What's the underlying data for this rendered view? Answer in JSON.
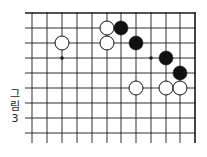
{
  "figure": {
    "caption_chars": [
      "그",
      "림",
      "3"
    ],
    "caption": "그림 3"
  },
  "board": {
    "columns_x": [
      32,
      47,
      62,
      77,
      92,
      107,
      121,
      136,
      151,
      166,
      180,
      195
    ],
    "rows_y": [
      13,
      28,
      43,
      58,
      73,
      88,
      103,
      118,
      133
    ],
    "h_line_start_x": 25,
    "v_line_end_y": 143,
    "top_edge": true,
    "right_edge": true,
    "line_color": "#1a1a1a",
    "star_points": [
      {
        "col": 2,
        "row": 3
      },
      {
        "col": 8,
        "row": 3
      }
    ],
    "stones": [
      {
        "color": "white",
        "col": 5,
        "row": 1
      },
      {
        "color": "black",
        "col": 6,
        "row": 1
      },
      {
        "color": "white",
        "col": 2,
        "row": 2
      },
      {
        "color": "white",
        "col": 5,
        "row": 2
      },
      {
        "color": "black",
        "col": 7,
        "row": 2
      },
      {
        "color": "black",
        "col": 9,
        "row": 3
      },
      {
        "color": "black",
        "col": 10,
        "row": 4
      },
      {
        "color": "white",
        "col": 7,
        "row": 5
      },
      {
        "color": "white",
        "col": 9,
        "row": 5
      },
      {
        "color": "white",
        "col": 10,
        "row": 5
      }
    ],
    "stone_radius": 7
  }
}
